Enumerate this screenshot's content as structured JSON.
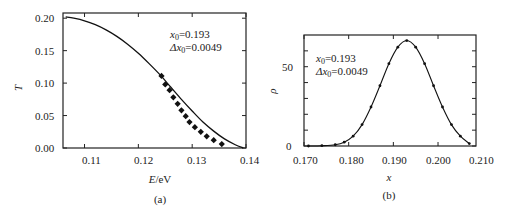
{
  "chart_data": [
    {
      "id": "a",
      "type": "line",
      "caption": "(a)",
      "title": "",
      "xlabel": "E/eV",
      "xlabel_italic": "E",
      "xlabel_unit": "/eV",
      "ylabel": "T",
      "xlim": [
        0.106,
        0.14
      ],
      "ylim": [
        0.0,
        0.208
      ],
      "xticks": [
        0.11,
        0.12,
        0.13,
        0.14
      ],
      "xtick_labels": [
        "0.11",
        "0.12",
        "0.13",
        "0.14"
      ],
      "yticks": [
        0.0,
        0.05,
        0.1,
        0.15,
        0.2
      ],
      "ytick_labels": [
        "0.00",
        "0.05",
        "0.10",
        "0.15",
        "0.20"
      ],
      "grid": false,
      "annotations": [
        "x0=0.193",
        "Δx0=0.0049"
      ],
      "series": [
        {
          "name": "fit curve",
          "style": "line",
          "x": [
            0.1065,
            0.108,
            0.11,
            0.112,
            0.114,
            0.116,
            0.118,
            0.12,
            0.122,
            0.124,
            0.126,
            0.128,
            0.13,
            0.132,
            0.134,
            0.136,
            0.138,
            0.1395
          ],
          "y": [
            0.202,
            0.2,
            0.196,
            0.19,
            0.182,
            0.172,
            0.16,
            0.146,
            0.13,
            0.113,
            0.094,
            0.075,
            0.057,
            0.04,
            0.026,
            0.014,
            0.005,
            0.0
          ]
        },
        {
          "name": "data points",
          "style": "markers",
          "x": [
            0.1243,
            0.125,
            0.1258,
            0.1265,
            0.1273,
            0.128,
            0.1288,
            0.1295,
            0.1305,
            0.1316,
            0.1327,
            0.134,
            0.1355
          ],
          "y": [
            0.111,
            0.098,
            0.089,
            0.078,
            0.068,
            0.058,
            0.049,
            0.04,
            0.032,
            0.025,
            0.018,
            0.012,
            0.006
          ]
        }
      ]
    },
    {
      "id": "b",
      "type": "line",
      "caption": "(b)",
      "title": "",
      "xlabel": "x",
      "ylabel": "ρ",
      "xlim": [
        0.17,
        0.2085
      ],
      "ylim": [
        0,
        70
      ],
      "xticks": [
        0.17,
        0.18,
        0.19,
        0.2,
        0.21
      ],
      "xtick_labels": [
        "0.170",
        "0.180",
        "0.190",
        "0.200",
        "0.210"
      ],
      "yticks": [
        0,
        50
      ],
      "ytick_labels": [
        "0",
        "50"
      ],
      "y_minor_ticks": [
        10,
        20,
        30,
        40,
        60
      ],
      "grid": false,
      "annotations": [
        "x0=0.193",
        "Δx0=0.0049"
      ],
      "series": [
        {
          "name": "Gaussian distribution",
          "style": "line-with-markers",
          "x": [
            0.171,
            0.174,
            0.177,
            0.179,
            0.181,
            0.183,
            0.185,
            0.187,
            0.189,
            0.191,
            0.193,
            0.195,
            0.197,
            0.199,
            0.201,
            0.203,
            0.205,
            0.207
          ],
          "y": [
            0.0,
            0.2,
            0.8,
            2.4,
            6.2,
            13.5,
            24.6,
            38.0,
            51.9,
            62.3,
            66.5,
            62.3,
            51.9,
            38.0,
            24.6,
            13.5,
            6.2,
            1.5
          ]
        }
      ]
    }
  ],
  "panels": {
    "a": {
      "caption": "(a)",
      "ylabel": "T",
      "xlabel_var": "E",
      "xlabel_unit": "/eV",
      "annot_line1_var": "x",
      "annot_line1_sub": "0",
      "annot_line1_val": "=0.193",
      "annot_line2_pre": "Δx",
      "annot_line2_sub": "0",
      "annot_line2_val": "=0.0049",
      "xtick_labels": [
        "0.11",
        "0.12",
        "0.13",
        "0.14"
      ],
      "ytick_labels": [
        "0.00",
        "0.05",
        "0.10",
        "0.15",
        "0.20"
      ]
    },
    "b": {
      "caption": "(b)",
      "ylabel": "ρ",
      "xlabel": "x",
      "annot_line1_var": "x",
      "annot_line1_sub": "0",
      "annot_line1_val": "=0.193",
      "annot_line2_pre": "Δx",
      "annot_line2_sub": "0",
      "annot_line2_val": "=0.0049",
      "xtick_labels": [
        "0.170",
        "0.180",
        "0.190",
        "0.200",
        "0.210"
      ],
      "ytick_labels": [
        "0",
        "50"
      ]
    }
  }
}
